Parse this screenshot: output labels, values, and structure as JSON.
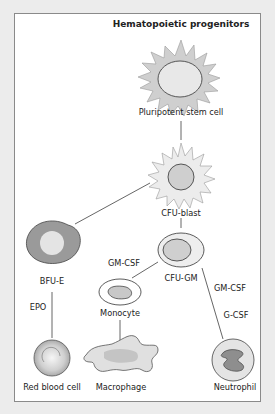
{
  "diagram": {
    "title": "Hematopoietic progenitors",
    "colors": {
      "background": "#ececec",
      "panel": "#ffffff",
      "border": "#8a8a8a",
      "cell_light": "#e6e6e6",
      "cell_mid": "#c8c8c8",
      "cell_dark": "#9a9a9a",
      "line": "#555555"
    },
    "cells": {
      "stem": "Pluripotent stem cell",
      "blast": "CFU-blast",
      "bfue": "BFU-E",
      "cfugm": "CFU-GM",
      "monocyte": "Monocyte",
      "rbc": "Red blood cell",
      "macrophage": "Macrophage",
      "neutrophil": "Neutrophil"
    },
    "factors": {
      "gmcsf_mono": "GM-CSF",
      "epo": "EPO",
      "gmcsf_neut": "GM-CSF",
      "gcsf": "G-CSF"
    }
  }
}
